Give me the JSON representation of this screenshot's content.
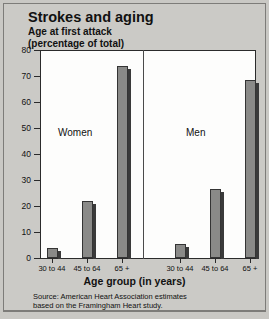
{
  "chart_data": {
    "type": "bar",
    "title": "Strokes and aging",
    "subtitle": "Age at first attack\n(percentage of total)",
    "xlabel": "Age group (in years)",
    "ylabel": "",
    "ylim": [
      0,
      80
    ],
    "ytick_labels": [
      "0",
      "10",
      "20",
      "30",
      "40",
      "50",
      "60",
      "70",
      "80"
    ],
    "ytick_values": [
      0,
      10,
      20,
      30,
      40,
      50,
      60,
      70,
      80
    ],
    "grid": false,
    "legend": "none",
    "categories": [
      "30 to 44",
      "45 to 64",
      "65 +"
    ],
    "panels": [
      {
        "label": "Women",
        "categories": [
          "30 to 44",
          "45 to 64",
          "65 +"
        ],
        "values": [
          4,
          22,
          74
        ]
      },
      {
        "label": "Men",
        "categories": [
          "30 to 44",
          "45 to 64",
          "65 +"
        ],
        "values": [
          5.5,
          26.5,
          68.5
        ]
      }
    ],
    "series": [
      {
        "name": "Women",
        "values": [
          4,
          22,
          74
        ]
      },
      {
        "name": "Men",
        "values": [
          5.5,
          26.5,
          68.5
        ]
      }
    ],
    "annotations": [
      "Women",
      "Men"
    ],
    "source_note": "Source: American Heart Association estimates\nbased on the Framingham Heart study.",
    "bar_color": "#8a8a88",
    "bar_edge_color": "#343434",
    "plot_background": "#fdfdfc",
    "page_background": "#c9c8c4"
  }
}
